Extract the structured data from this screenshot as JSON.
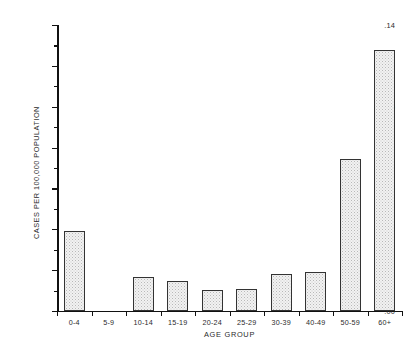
{
  "chart_data": {
    "type": "bar",
    "title": "",
    "xlabel": "AGE GROUP",
    "ylabel": "CASES PER 100,000 POPULATION",
    "categories": [
      "0-4",
      "5-9",
      "10-14",
      "15-19",
      "20-24",
      "25-29",
      "30-39",
      "40-49",
      "50-59",
      "60+"
    ],
    "values": [
      0.039,
      0.0,
      0.0165,
      0.0145,
      0.0105,
      0.011,
      0.018,
      0.019,
      0.0745,
      0.128
    ],
    "ylim": [
      0.0,
      0.14
    ],
    "ytick_labels": [
      ".00",
      ".02",
      ".04",
      ".06",
      ".08",
      ".10",
      ".12",
      ".14"
    ],
    "ytick_values": [
      0.0,
      0.02,
      0.04,
      0.06,
      0.08,
      0.1,
      0.12,
      0.14
    ],
    "yminor_values": [
      0.01,
      0.03,
      0.05,
      0.07,
      0.09,
      0.11,
      0.13
    ],
    "grid": false,
    "legend": null,
    "bar_fill_color": "#f2f2f2",
    "bar_edge_color": "#333333",
    "axis_color": "#111111",
    "background_color": "#ffffff"
  }
}
